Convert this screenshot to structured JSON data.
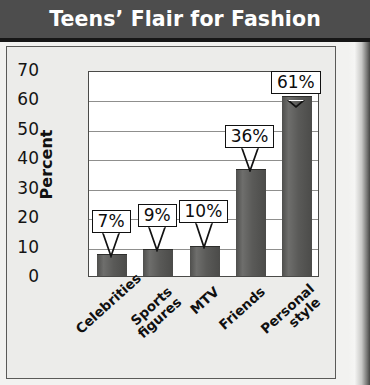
{
  "header": {
    "title": "Teens’ Flair for Fashion"
  },
  "chart_data": {
    "type": "bar",
    "title": "Teens’ Flair for Fashion",
    "xlabel": "",
    "ylabel": "Percent",
    "ylim": [
      0,
      70
    ],
    "yticks": [
      70,
      60,
      50,
      40,
      30,
      20,
      10,
      0
    ],
    "grid": true,
    "legend": "none",
    "categories": [
      "Celebrities",
      "Sports figures",
      "MTV",
      "Friends",
      "Personal style"
    ],
    "category_lines": [
      [
        "Celebrities"
      ],
      [
        "Sports",
        "figures"
      ],
      [
        "MTV"
      ],
      [
        "Friends"
      ],
      [
        "Personal",
        "style"
      ]
    ],
    "values": [
      7,
      9,
      10,
      36,
      61
    ],
    "data_labels": [
      "7%",
      "9%",
      "10%",
      "36%",
      "61%"
    ],
    "bar_color": "#5a5a58",
    "plot_background": "#ffffff",
    "panel_background": "#ececea",
    "title_bar_color": "#4d4d4d",
    "title_text_color": "#ffffff",
    "gridline_color": "#8f8f8d",
    "axis_color": "#4a4a48",
    "callout_border_color": "#111111",
    "callout_fill_color": "#ffffff"
  }
}
